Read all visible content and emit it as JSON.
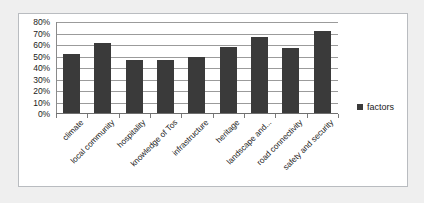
{
  "chart_data": {
    "type": "bar",
    "title": "",
    "xlabel": "",
    "ylabel": "",
    "categories": [
      "climate",
      "local community",
      "hospitality",
      "knowledge of Tos",
      "infrastructure",
      "heritage",
      "landscape and...",
      "road connectivity",
      "safety and security"
    ],
    "series": [
      {
        "name": "factors",
        "values": [
          52,
          62,
          47,
          47,
          50,
          58,
          67,
          57,
          72
        ],
        "color": "#3a3a3a"
      }
    ],
    "ylim": [
      0,
      80
    ],
    "ytick_labels": [
      "80%",
      "70%",
      "60%",
      "50%",
      "40%",
      "30%",
      "20%",
      "10%",
      "0%"
    ],
    "ytick_values": [
      80,
      70,
      60,
      50,
      40,
      30,
      20,
      10,
      0
    ],
    "grid": true,
    "legend_position": "right",
    "legend_entries": [
      "factors"
    ]
  },
  "legend": {
    "label": "factors"
  },
  "colors": {
    "bar": "#3a3a3a",
    "gridline": "#9b9b9b",
    "border": "#b9bcc0",
    "background": "#ffffff",
    "page_background": "#efefef",
    "text": "#1a1a1a"
  }
}
